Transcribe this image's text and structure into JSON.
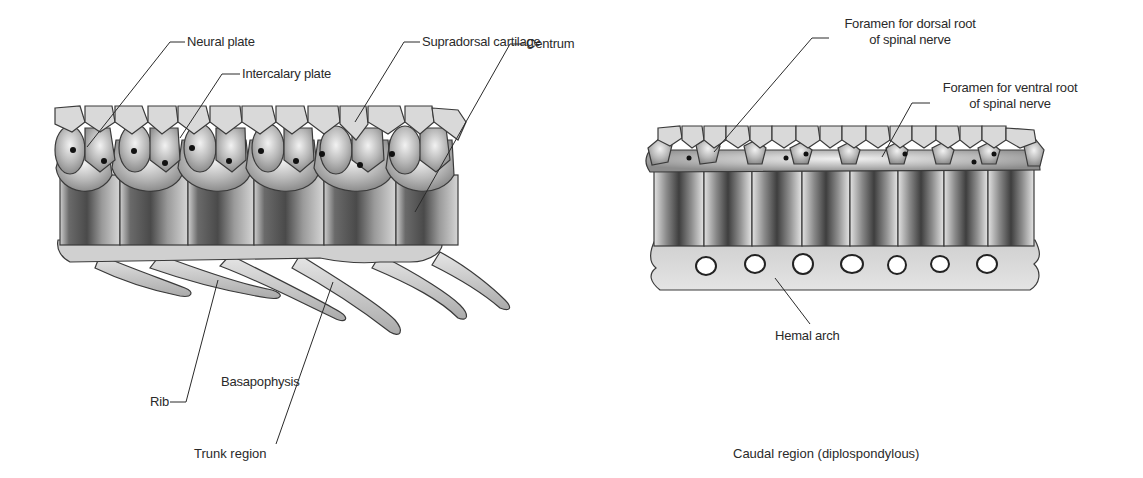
{
  "panels": [
    {
      "id": "trunk",
      "caption": "Trunk region",
      "labels": {
        "neural_plate": "Neural plate",
        "intercalary_plate": "Intercalary plate",
        "supradorsal_cartilage": "Supradorsal cartilage",
        "centrum": "Centrum",
        "rib": "Rib",
        "basapophysis": "Basapophysis"
      },
      "vertebra_count": 6
    },
    {
      "id": "caudal",
      "caption": "Caudal region (diplospondylous)",
      "labels": {
        "foramen_dorsal_line1": "Foramen for dorsal root",
        "foramen_dorsal_line2": "of spinal nerve",
        "foramen_ventral_line1": "Foramen for ventral root",
        "foramen_ventral_line2": "of spinal nerve",
        "hemal_arch": "Hemal arch"
      },
      "centrum_count": 8
    }
  ],
  "colors": {
    "ink": "#2a2a2a",
    "bone_light": "#d8d8d8",
    "bone_mid": "#a9a9a9",
    "bone_dark": "#5e5e5e"
  }
}
